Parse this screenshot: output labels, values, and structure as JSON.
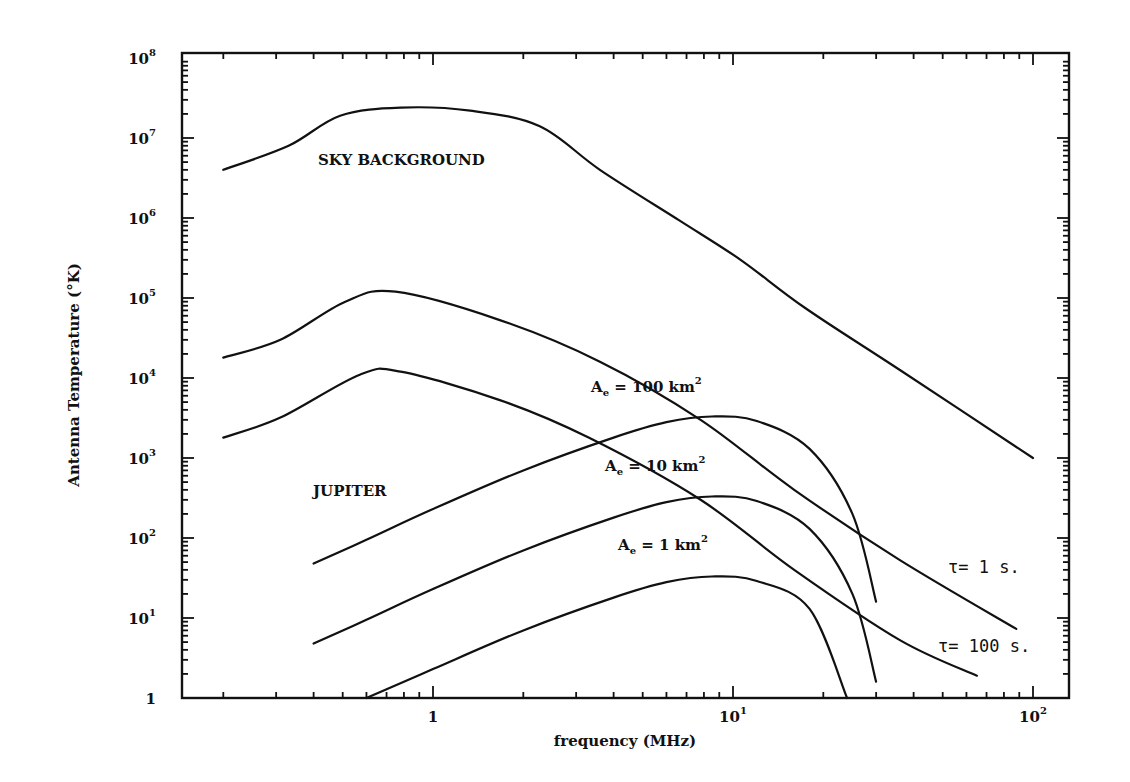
{
  "chart_data": {
    "type": "line",
    "title": "",
    "xlabel": "frequency (MHz)",
    "ylabel": "Antenna Temperature (°K)",
    "xscale": "log",
    "yscale": "log",
    "xlim": [
      0.15,
      130
    ],
    "ylim": [
      1,
      100000000
    ],
    "grid": false,
    "legend": null,
    "x_ticks": [
      {
        "value": 1,
        "label": "1"
      },
      {
        "value": 10,
        "label": "10",
        "exp": "1"
      },
      {
        "value": 100,
        "label": "10",
        "exp": "2"
      }
    ],
    "y_ticks": [
      {
        "value": 1,
        "label": "1"
      },
      {
        "value": 10,
        "label": "10",
        "exp": "1"
      },
      {
        "value": 100,
        "label": "10",
        "exp": "2"
      },
      {
        "value": 1000,
        "label": "10",
        "exp": "3"
      },
      {
        "value": 10000,
        "label": "10",
        "exp": "4"
      },
      {
        "value": 100000,
        "label": "10",
        "exp": "5"
      },
      {
        "value": 1000000,
        "label": "10",
        "exp": "6"
      },
      {
        "value": 10000000,
        "label": "10",
        "exp": "7"
      },
      {
        "value": 100000000,
        "label": "10",
        "exp": "8"
      }
    ],
    "series": [
      {
        "name": "Sky background",
        "x": [
          0.2,
          0.33,
          0.49,
          0.78,
          1.33,
          2.27,
          3.6,
          6.6,
          10.6,
          17.4,
          36,
          100
        ],
        "y": [
          4000000,
          8000000,
          19000000,
          24000000,
          22000000,
          14000000,
          4000000,
          940000,
          300000,
          75000,
          12600,
          1000
        ]
      },
      {
        "name": "Jupiter (tau = 1 s)",
        "x": [
          0.2,
          0.31,
          0.51,
          0.75,
          1.67,
          3.6,
          7.8,
          16,
          36,
          88
        ],
        "y": [
          18000,
          30000,
          90000,
          120000,
          53000,
          16000,
          3000,
          400,
          53,
          7.3
        ]
      },
      {
        "name": "Jupiter (tau = 100 s)",
        "x": [
          0.2,
          0.31,
          0.57,
          0.78,
          1.67,
          3.3,
          7.8,
          16,
          36,
          65
        ],
        "y": [
          1800,
          3200,
          11000,
          12000,
          5300,
          1800,
          300,
          40,
          5.3,
          1.9
        ]
      },
      {
        "name": "Ae = 100 km^2",
        "x": [
          0.4,
          0.6,
          1.0,
          2.0,
          4.0,
          6.0,
          8.5,
          12,
          18,
          25,
          30
        ],
        "y": [
          48,
          95,
          230,
          700,
          1800,
          2800,
          3300,
          2900,
          1300,
          200,
          16
        ]
      },
      {
        "name": "Ae = 10 km^2",
        "x": [
          0.4,
          0.6,
          1.0,
          2.0,
          4.0,
          6.0,
          8.5,
          12,
          18,
          25,
          30
        ],
        "y": [
          4.8,
          9.5,
          23,
          70,
          180,
          280,
          330,
          290,
          130,
          20,
          1.6
        ]
      },
      {
        "name": "Ae = 1 km^2",
        "x": [
          0.6,
          1.0,
          2.0,
          4.0,
          6.0,
          8.5,
          12,
          18,
          24
        ],
        "y": [
          1,
          2.3,
          7,
          18,
          28,
          33,
          29,
          13,
          1
        ]
      }
    ],
    "annotations": [
      {
        "text": "SKY BACKGROUND",
        "x": 0.8,
        "y": 5000000
      },
      {
        "text": "JUPITER",
        "x": 0.25,
        "y": 600
      },
      {
        "text": "Ae = 100 km²",
        "x": 3.8,
        "y": 5000
      },
      {
        "text": "Ae = 10 km²",
        "x": 4.2,
        "y": 500
      },
      {
        "text": "Ae = 1 km²",
        "x": 4.8,
        "y": 50
      },
      {
        "text": "τ = 1 s.",
        "x": 65,
        "y": 18
      },
      {
        "text": "τ = 100 s.",
        "x": 60,
        "y": 2
      }
    ]
  },
  "labels": {
    "xlabel": "frequency (MHz)",
    "ylabel": "Antenna Temperature (°K)",
    "sky": "SKY BACKGROUND",
    "jupiter": "JUPITER",
    "ae100_prefix": "A",
    "ae100_sub": "e",
    "ae100_text": " = 100 km",
    "ae10_text": " = 10 km",
    "ae1_text": " = 1 km",
    "sq": "2",
    "tau1": "τ= 1 s.",
    "tau100": "τ= 100 s."
  }
}
